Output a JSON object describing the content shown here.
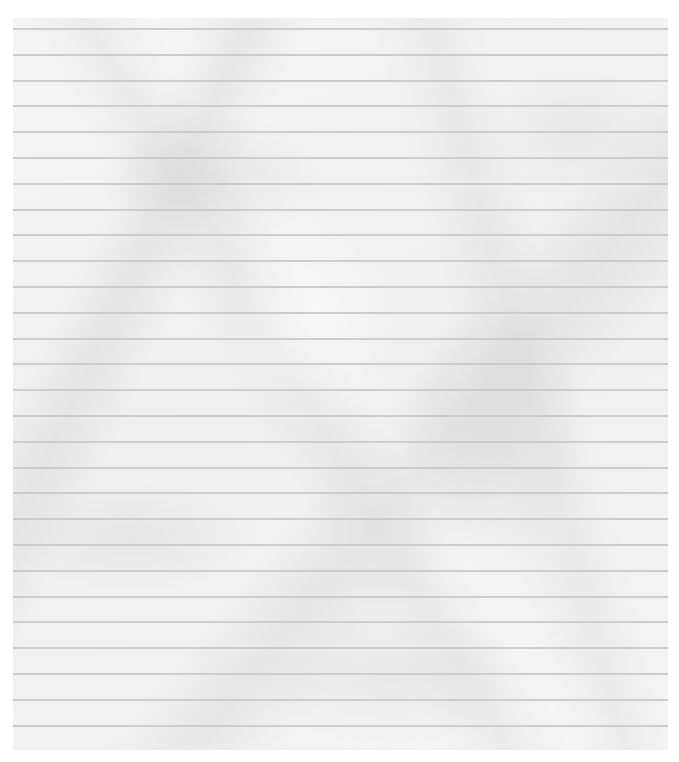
{
  "paper": {
    "kind": "crumpled lined notebook paper",
    "background_color": "#f1f1f1",
    "line_color": "#c6c6c6",
    "line_count": 28,
    "first_line_offset_px": 10,
    "line_spacing_px": 25.8,
    "text": ""
  }
}
